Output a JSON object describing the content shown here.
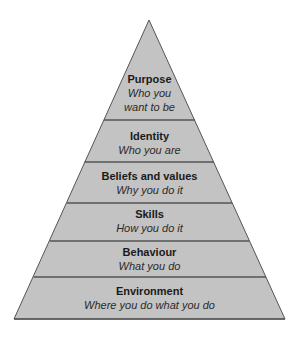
{
  "diagram": {
    "type": "pyramid",
    "colors": {
      "fill": "#c3c3c3",
      "stroke": "#555555",
      "text": "#1a1a1a",
      "background": "#ffffff"
    },
    "levels": [
      {
        "title": "Purpose",
        "subtitle_lines": [
          "Who you",
          "want to be"
        ]
      },
      {
        "title": "Identity",
        "subtitle_lines": [
          "Who you are"
        ]
      },
      {
        "title": "Beliefs and values",
        "subtitle_lines": [
          "Why you do it"
        ]
      },
      {
        "title": "Skills",
        "subtitle_lines": [
          "How you do it"
        ]
      },
      {
        "title": "Behaviour",
        "subtitle_lines": [
          "What you do"
        ]
      },
      {
        "title": "Environment",
        "subtitle_lines": [
          "Where you do what you do"
        ]
      }
    ]
  }
}
